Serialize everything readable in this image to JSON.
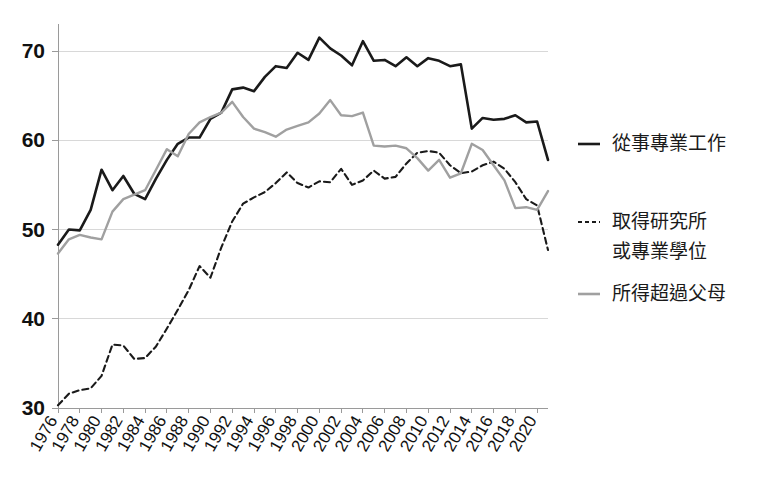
{
  "chart_data": {
    "type": "line",
    "title": "",
    "subtitle": "",
    "xlabel": "",
    "ylabel": "",
    "xlim": [
      1976,
      2021
    ],
    "ylim": [
      30,
      73
    ],
    "grid": true,
    "gridlines_y": [
      30,
      40,
      50,
      60,
      70
    ],
    "legend_position": "right",
    "x": [
      1976,
      1977,
      1978,
      1979,
      1980,
      1981,
      1982,
      1983,
      1984,
      1985,
      1986,
      1987,
      1988,
      1989,
      1990,
      1991,
      1992,
      1993,
      1994,
      1995,
      1996,
      1997,
      1998,
      1999,
      2000,
      2001,
      2002,
      2003,
      2004,
      2005,
      2006,
      2007,
      2008,
      2009,
      2010,
      2011,
      2012,
      2013,
      2014,
      2015,
      2016,
      2017,
      2018,
      2019,
      2020,
      2021
    ],
    "xticks": [
      "1976",
      "1978",
      "1980",
      "1982",
      "1984",
      "1986",
      "1988",
      "1990",
      "1992",
      "1994",
      "1996",
      "1998",
      "2000",
      "2002",
      "2004",
      "2006",
      "2008",
      "2010",
      "2012",
      "2014",
      "2016",
      "2018",
      "2020"
    ],
    "yticks": [
      "30",
      "40",
      "50",
      "60",
      "70"
    ],
    "series": [
      {
        "name": "從事專業工作",
        "style": "solid",
        "color": "#1a1a1a",
        "width": 2.6,
        "values": [
          48.3,
          50.0,
          49.9,
          52.2,
          56.7,
          54.4,
          56.0,
          54.0,
          53.4,
          55.7,
          57.8,
          59.6,
          60.3,
          60.3,
          62.4,
          63.1,
          65.7,
          65.9,
          65.5,
          67.1,
          68.3,
          68.1,
          69.8,
          69.0,
          71.5,
          70.3,
          69.5,
          68.4,
          71.1,
          68.9,
          69.0,
          68.3,
          69.3,
          68.3,
          69.2,
          68.9,
          68.3,
          68.5,
          61.3,
          62.5,
          62.3,
          62.4,
          62.8,
          62.0,
          62.1,
          57.8
        ]
      },
      {
        "name": "取得研究所或專業學位",
        "style": "dashed",
        "color": "#1a1a1a",
        "width": 2.1,
        "values": [
          30.3,
          31.6,
          32.0,
          32.2,
          33.6,
          37.1,
          37.0,
          35.5,
          35.6,
          36.9,
          38.9,
          41.0,
          43.2,
          45.9,
          44.6,
          48.0,
          50.9,
          52.9,
          53.6,
          54.2,
          55.2,
          56.4,
          55.2,
          54.7,
          55.4,
          55.3,
          56.8,
          55.0,
          55.5,
          56.6,
          55.7,
          55.9,
          57.4,
          58.6,
          58.8,
          58.6,
          57.2,
          56.3,
          56.5,
          57.2,
          57.6,
          56.8,
          55.3,
          53.4,
          52.7,
          47.7
        ]
      },
      {
        "name": "所得超過父母",
        "style": "solid",
        "color": "#a0a0a0",
        "width": 2.4,
        "values": [
          47.3,
          48.9,
          49.4,
          49.1,
          48.9,
          52.0,
          53.4,
          53.9,
          54.4,
          56.7,
          59.0,
          58.2,
          60.7,
          62.0,
          62.6,
          63.1,
          64.3,
          62.6,
          61.3,
          60.9,
          60.4,
          61.2,
          61.6,
          62.0,
          63.0,
          64.5,
          62.8,
          62.7,
          63.1,
          59.4,
          59.3,
          59.4,
          59.1,
          58.0,
          56.6,
          57.8,
          55.8,
          56.3,
          59.6,
          58.9,
          57.2,
          55.5,
          52.4,
          52.5,
          52.2,
          54.3
        ]
      }
    ]
  },
  "legend": {
    "items": [
      {
        "label": "從事專業工作",
        "style": "solid",
        "color": "#1a1a1a"
      },
      {
        "label_line1": "取得研究所",
        "label_line2": "或專業學位",
        "style": "dashed",
        "color": "#1a1a1a"
      },
      {
        "label": "所得超過父母",
        "style": "solid",
        "color": "#a0a0a0"
      }
    ]
  }
}
